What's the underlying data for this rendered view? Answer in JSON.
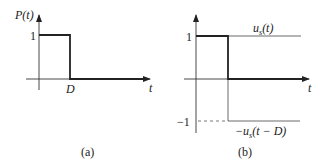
{
  "panel_a": {
    "y_label": "P(t)",
    "y_tick": "1",
    "x_tick": "D",
    "x_label": "t",
    "caption": "(a)"
  },
  "panel_b": {
    "y_tick_pos": "1",
    "y_tick_neg": "−1",
    "x_label": "t",
    "curve_upper_label": "u",
    "curve_upper_sub": "s",
    "curve_upper_arg": "(t)",
    "curve_lower_prefix": "−u",
    "curve_lower_sub": "s",
    "curve_lower_arg": "(t − D)",
    "caption": "(b)"
  },
  "colors": {
    "line": "#222222",
    "thin_line": "#444444"
  }
}
